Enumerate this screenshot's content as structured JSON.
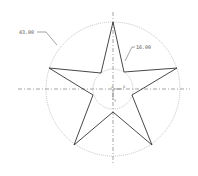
{
  "drawing": {
    "labels": {
      "outer_diameter": "43.00",
      "inner_diameter": "16.00",
      "axis_x": "X",
      "axis_y": "Y"
    },
    "colors": {
      "star": "#333333",
      "construction": "#aaaaaa",
      "centerline": "#666666",
      "leader": "#666666",
      "background": "#ffffff"
    }
  }
}
